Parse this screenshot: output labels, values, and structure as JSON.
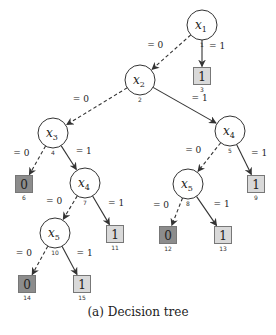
{
  "caption": "(a) Decision tree",
  "colors": {
    "leaf0_fill": "#8c8c8c",
    "leaf1_fill": "#d9d9d9",
    "stroke": "#333333",
    "node_fill": "#ffffff"
  },
  "nodes": [
    {
      "id": "1",
      "type": "decision",
      "var": "x",
      "sub": "1",
      "cx": 202,
      "cy": 25
    },
    {
      "id": "2",
      "type": "decision",
      "var": "x",
      "sub": "2",
      "cx": 140,
      "cy": 80
    },
    {
      "id": "3",
      "type": "leaf",
      "value": "1",
      "cx": 202,
      "cy": 76
    },
    {
      "id": "4",
      "type": "decision",
      "var": "x",
      "sub": "3",
      "cx": 53,
      "cy": 133
    },
    {
      "id": "5",
      "type": "decision",
      "var": "x",
      "sub": "4",
      "cx": 230,
      "cy": 131
    },
    {
      "id": "6",
      "type": "leaf",
      "value": "0",
      "cx": 24,
      "cy": 184
    },
    {
      "id": "7",
      "type": "decision",
      "var": "x",
      "sub": "4",
      "cx": 85,
      "cy": 183
    },
    {
      "id": "8",
      "type": "decision",
      "var": "x",
      "sub": "5",
      "cx": 188,
      "cy": 184
    },
    {
      "id": "9",
      "type": "leaf",
      "value": "1",
      "cx": 256,
      "cy": 184
    },
    {
      "id": "10",
      "type": "decision",
      "var": "x",
      "sub": "5",
      "cx": 55,
      "cy": 233
    },
    {
      "id": "11",
      "type": "leaf",
      "value": "1",
      "cx": 115,
      "cy": 234
    },
    {
      "id": "12",
      "type": "leaf",
      "value": "0",
      "cx": 168,
      "cy": 235
    },
    {
      "id": "13",
      "type": "leaf",
      "value": "1",
      "cx": 223,
      "cy": 235
    },
    {
      "id": "14",
      "type": "leaf",
      "value": "0",
      "cx": 27,
      "cy": 284
    },
    {
      "id": "15",
      "type": "leaf",
      "value": "1",
      "cx": 82,
      "cy": 284
    }
  ],
  "edges": [
    {
      "from": "1",
      "to": "2",
      "label": "= 0",
      "style": "dashed"
    },
    {
      "from": "1",
      "to": "3",
      "label": "= 1",
      "style": "solid"
    },
    {
      "from": "2",
      "to": "4",
      "label": "= 0",
      "style": "dashed"
    },
    {
      "from": "2",
      "to": "5",
      "label": "= 1",
      "style": "solid"
    },
    {
      "from": "4",
      "to": "6",
      "label": "= 0",
      "style": "dashed"
    },
    {
      "from": "4",
      "to": "7",
      "label": "= 1",
      "style": "solid"
    },
    {
      "from": "5",
      "to": "8",
      "label": "= 0",
      "style": "dashed"
    },
    {
      "from": "5",
      "to": "9",
      "label": "= 1",
      "style": "solid"
    },
    {
      "from": "7",
      "to": "10",
      "label": "= 0",
      "style": "dashed"
    },
    {
      "from": "7",
      "to": "11",
      "label": "= 1",
      "style": "solid"
    },
    {
      "from": "8",
      "to": "12",
      "label": "= 0",
      "style": "dashed"
    },
    {
      "from": "8",
      "to": "13",
      "label": "= 1",
      "style": "solid"
    },
    {
      "from": "10",
      "to": "14",
      "label": "= 0",
      "style": "dashed"
    },
    {
      "from": "10",
      "to": "15",
      "label": "= 1",
      "style": "solid"
    }
  ]
}
